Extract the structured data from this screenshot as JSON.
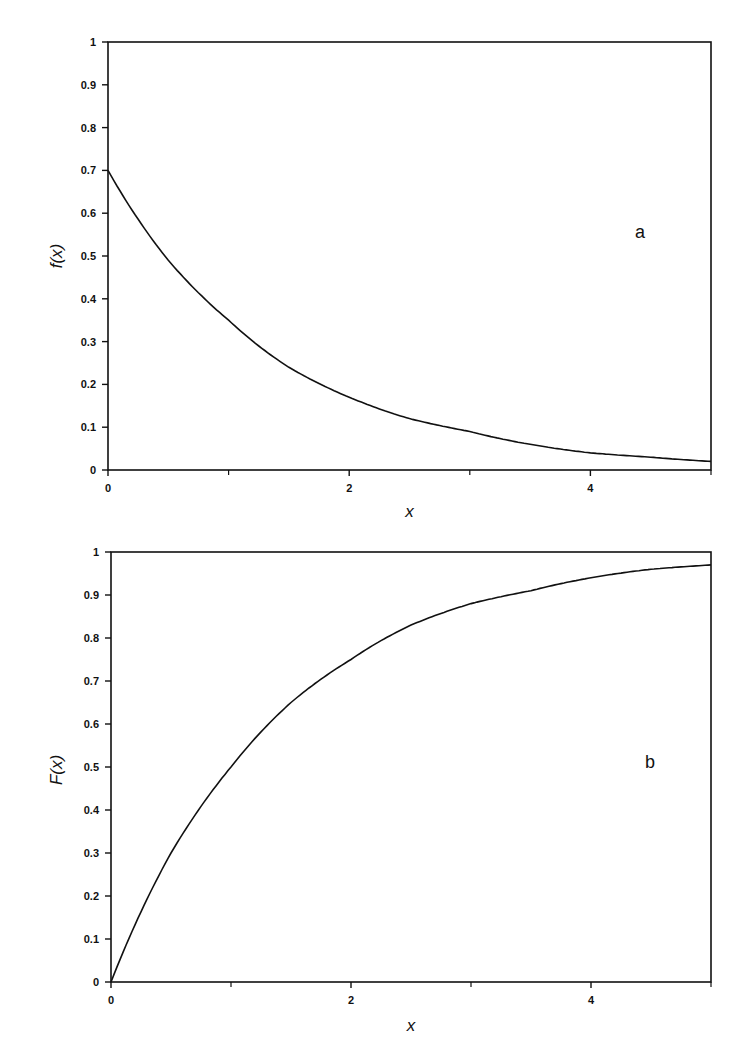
{
  "chart_data": [
    {
      "type": "line",
      "panel_label": "a",
      "title": "",
      "xlabel": "x",
      "ylabel": "f(x)",
      "xlim": [
        0,
        5
      ],
      "ylim": [
        0,
        1
      ],
      "x_ticks": [
        0,
        2,
        4
      ],
      "x_minor_ticks": [
        1,
        3,
        5
      ],
      "y_ticks": [
        0,
        0.1,
        0.2,
        0.3,
        0.4,
        0.5,
        0.6,
        0.7,
        0.8,
        0.9,
        1
      ],
      "y_tick_labels": [
        "0",
        "0.1",
        "0.2",
        "0.3",
        "0.4",
        "0.5",
        "0.6",
        "0.7",
        "0.8",
        "0.9",
        "1"
      ],
      "grid": false,
      "series": [
        {
          "name": "f(x)",
          "x": [
            0,
            0.5,
            1,
            1.5,
            2,
            2.5,
            3,
            3.5,
            4,
            4.5,
            5
          ],
          "values": [
            0.7,
            0.49,
            0.35,
            0.24,
            0.17,
            0.12,
            0.09,
            0.06,
            0.04,
            0.03,
            0.02
          ]
        }
      ]
    },
    {
      "type": "line",
      "panel_label": "b",
      "title": "",
      "xlabel": "x",
      "ylabel": "F(x)",
      "xlim": [
        0,
        5
      ],
      "ylim": [
        0,
        1
      ],
      "x_ticks": [
        0,
        2,
        4
      ],
      "x_minor_ticks": [
        1,
        3,
        5
      ],
      "y_ticks": [
        0,
        0.1,
        0.2,
        0.3,
        0.4,
        0.5,
        0.6,
        0.7,
        0.8,
        0.9,
        1
      ],
      "y_tick_labels": [
        "0",
        "0.1",
        "0.2",
        "0.3",
        "0.4",
        "0.5",
        "0.6",
        "0.7",
        "0.8",
        "0.9",
        "1"
      ],
      "grid": false,
      "series": [
        {
          "name": "F(x)",
          "x": [
            0,
            0.5,
            1,
            1.5,
            2,
            2.5,
            3,
            3.5,
            4,
            4.5,
            5
          ],
          "values": [
            0.0,
            0.3,
            0.5,
            0.65,
            0.75,
            0.83,
            0.88,
            0.91,
            0.94,
            0.96,
            0.97
          ]
        }
      ]
    }
  ]
}
